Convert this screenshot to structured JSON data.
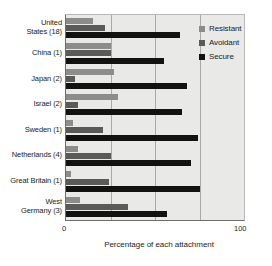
{
  "chart_data": {
    "type": "bar",
    "orientation": "horizontal",
    "title": "",
    "xlabel": "Percentage of each attachment",
    "ylabel": "",
    "xlim": [
      0,
      100
    ],
    "xticks": [
      0,
      100
    ],
    "xtick_labels": [
      "0",
      "100"
    ],
    "gridlines": [
      25,
      50,
      75
    ],
    "grid": true,
    "legend_position": "top-right",
    "categories": [
      "United\nStates (18)",
      "China (1)",
      "Japan (2)",
      "Israel (2)",
      "Sweden (1)",
      "Netherlands (4)",
      "Great Britain (1)",
      "West\nGermany (3)"
    ],
    "category_lines": [
      [
        "United",
        "States (18)"
      ],
      [
        "China (1)"
      ],
      [
        "Japan (2)"
      ],
      [
        "Israel (2)"
      ],
      [
        "Sweden (1)"
      ],
      [
        "Netherlands (4)"
      ],
      [
        "Great Britain (1)"
      ],
      [
        "West",
        "Germany (3)"
      ]
    ],
    "series": [
      {
        "name": "Resistant",
        "color": "#8c8c8a",
        "values": [
          15,
          25,
          27,
          29,
          4,
          7,
          3,
          8
        ]
      },
      {
        "name": "Avoidant",
        "color": "#5a5a58",
        "values": [
          22,
          25,
          5,
          7,
          21,
          25,
          24,
          35
        ]
      },
      {
        "name": "Secure",
        "color": "#121212",
        "values": [
          64,
          55,
          68,
          65,
          74,
          70,
          75,
          57
        ]
      }
    ],
    "legend": [
      {
        "label": "Resistant",
        "color": "#8c8c8a"
      },
      {
        "label": "Avoidant",
        "color": "#5a5a58"
      },
      {
        "label": "Secure",
        "color": "#121212"
      }
    ],
    "plot_background": "#e9e9e7",
    "axis_color": "#6d6d6d",
    "grid_color": "#a9a9a7"
  }
}
